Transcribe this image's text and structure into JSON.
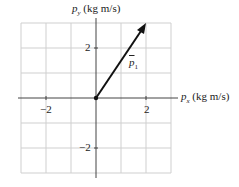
{
  "diagram": {
    "y_axis_label": "p",
    "y_axis_sub": "y",
    "y_axis_unit": "(kg m/s)",
    "x_axis_label": "p",
    "x_axis_sub": "x",
    "x_axis_unit": "(kg m/s)",
    "tick_x_neg": "−2",
    "tick_x_pos": "2",
    "tick_y_pos": "2",
    "tick_y_neg": "−2",
    "vector_label": "p",
    "vector_sub": "1",
    "vector": {
      "x": 2,
      "y": 3
    },
    "grid_range": [
      -3,
      3
    ]
  }
}
